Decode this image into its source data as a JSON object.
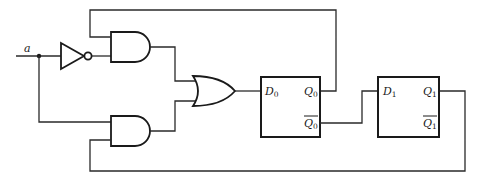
{
  "diagram": {
    "type": "sequential logic circuit",
    "input": {
      "label": "a"
    },
    "gates": [
      {
        "id": "not0",
        "type": "NOT",
        "input": "a"
      },
      {
        "id": "and_top",
        "type": "AND",
        "inputs": [
          "Q0",
          "not a"
        ]
      },
      {
        "id": "and_bottom",
        "type": "AND",
        "inputs": [
          "a",
          "Q1"
        ]
      },
      {
        "id": "or0",
        "type": "OR",
        "inputs": [
          "and_top",
          "and_bottom"
        ],
        "output": "D0"
      }
    ],
    "flipflops": [
      {
        "id": "ff0",
        "d_label": "D",
        "d_sub": "0",
        "q_label": "Q",
        "q_sub": "0",
        "qbar_label": "Q",
        "qbar_sub": "0"
      },
      {
        "id": "ff1",
        "d_label": "D",
        "d_sub": "1",
        "q_label": "Q",
        "q_sub": "1",
        "qbar_label": "Q",
        "qbar_sub": "1"
      }
    ],
    "connections": [
      "a -> NOT -> AND_top",
      "a -> AND_bottom",
      "Q0 -> AND_top (feedback)",
      "Q1 -> AND_bottom (feedback)",
      "AND_top, AND_bottom -> OR -> D0",
      "Q0bar -> D1"
    ]
  }
}
